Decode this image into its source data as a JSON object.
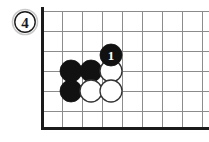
{
  "diagram": {
    "label": "4",
    "label_shape": "circle",
    "background_color": "#ffffff",
    "line_color": "#8c8c8c",
    "edge_color": "#1a1a1a",
    "black_stone_color": "#111111",
    "white_stone_color": "#ffffff",
    "white_stone_outline": "#333333",
    "grid": {
      "spacing": 20,
      "left_edge_x": 42,
      "bottom_edge_y": 128,
      "vertical_x": [
        42,
        62,
        82,
        102,
        122,
        142,
        162,
        182,
        202
      ],
      "horizontal_y": [
        11,
        31,
        51,
        71,
        91,
        111
      ]
    },
    "stone_radius": 11,
    "stones": [
      {
        "id": "black-a",
        "color": "black",
        "cx": 71,
        "cy": 71,
        "label": ""
      },
      {
        "id": "black-b",
        "color": "black",
        "cx": 91,
        "cy": 71,
        "label": ""
      },
      {
        "id": "black-c",
        "color": "black",
        "cx": 71,
        "cy": 91,
        "label": ""
      },
      {
        "id": "white-a",
        "color": "white",
        "cx": 111,
        "cy": 71,
        "label": ""
      },
      {
        "id": "white-b",
        "color": "white",
        "cx": 91,
        "cy": 91,
        "label": ""
      },
      {
        "id": "white-c",
        "color": "white",
        "cx": 111,
        "cy": 91,
        "label": ""
      },
      {
        "id": "black-move-1",
        "color": "black",
        "cx": 111,
        "cy": 55,
        "label": "1"
      }
    ]
  }
}
